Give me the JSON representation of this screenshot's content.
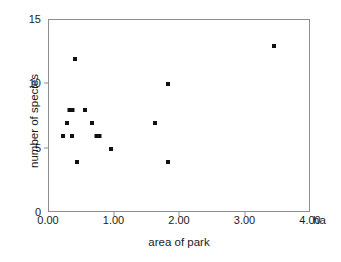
{
  "chart_data": {
    "type": "scatter",
    "title": "",
    "xlabel": "area of park",
    "ylabel": "number of species",
    "x_unit": "ha",
    "xlim": [
      0.0,
      4.0
    ],
    "ylim": [
      0,
      15
    ],
    "x_ticks": [
      "0.00",
      "1.00",
      "2.00",
      "3.00",
      "4.00"
    ],
    "x_tick_values": [
      0.0,
      1.0,
      2.0,
      3.0,
      4.0
    ],
    "y_ticks": [
      "0",
      "5",
      "10",
      "15"
    ],
    "y_tick_values": [
      0,
      5,
      10,
      15
    ],
    "grid": false,
    "legend": false,
    "marker": "square",
    "marker_color": "#111111",
    "frame_color": "#8d8d8d",
    "points": [
      {
        "x": 0.22,
        "y": 6,
        "overlap": 1
      },
      {
        "x": 0.28,
        "y": 7,
        "overlap": 1
      },
      {
        "x": 0.33,
        "y": 8,
        "overlap": 2
      },
      {
        "x": 0.35,
        "y": 6,
        "overlap": 1
      },
      {
        "x": 0.4,
        "y": 12,
        "overlap": 1
      },
      {
        "x": 0.42,
        "y": 4,
        "overlap": 1
      },
      {
        "x": 0.55,
        "y": 8,
        "overlap": 1
      },
      {
        "x": 0.65,
        "y": 7,
        "overlap": 1
      },
      {
        "x": 0.75,
        "y": 6,
        "overlap": 2
      },
      {
        "x": 0.95,
        "y": 5,
        "overlap": 1
      },
      {
        "x": 1.62,
        "y": 7,
        "overlap": 1
      },
      {
        "x": 1.82,
        "y": 10,
        "overlap": 1
      },
      {
        "x": 1.82,
        "y": 4,
        "overlap": 1
      },
      {
        "x": 3.43,
        "y": 13,
        "overlap": 1
      }
    ]
  }
}
